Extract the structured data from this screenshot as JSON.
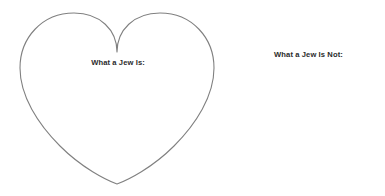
{
  "page": {
    "background_color": "#ffffff",
    "title": ""
  },
  "left_panel": {
    "shape": "heart-outline",
    "stroke_color": "#808080",
    "fill_color": "#ffffff",
    "stroke_width": "1",
    "caption": "What a Jew Is:"
  },
  "right_panel": {
    "heading": "What a Jew Is Not:",
    "text_color": "#2b2b2b"
  }
}
